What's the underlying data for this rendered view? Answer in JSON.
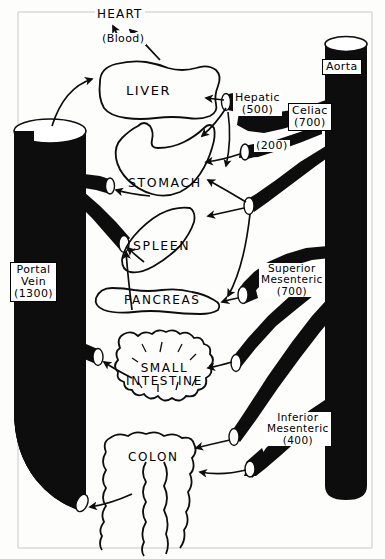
{
  "figure": {
    "background_color": "#fdfdfc",
    "ink_color": "#000000"
  },
  "annotations": {
    "heart": "HEART",
    "blood": "(Blood)"
  },
  "vessels": [
    {
      "id": "aorta",
      "name": "Aorta",
      "label": "Aorta",
      "flow": "",
      "label_style": "boxed",
      "x": 322,
      "y": 59,
      "font_size": 11
    },
    {
      "id": "portal-vein",
      "name": "Portal Vein",
      "label": "Portal\nVein\n(1300)",
      "flow": "1300",
      "label_style": "boxed",
      "x": 10,
      "y": 262,
      "font_size": 11
    },
    {
      "id": "hepatic-artery",
      "name": "Hepatic",
      "label": "Hepatic\n(500)",
      "flow": "500",
      "label_style": "plain",
      "x": 233,
      "y": 92,
      "font_size": 11
    },
    {
      "id": "celiac-artery",
      "name": "Celiac",
      "label": "Celiac\n(700)",
      "flow": "700",
      "label_style": "boxed",
      "x": 288,
      "y": 103,
      "font_size": 11
    },
    {
      "id": "left-gastric-artery",
      "name": "(200)",
      "label": "(200)",
      "flow": "200",
      "label_style": "plain",
      "x": 254,
      "y": 140,
      "font_size": 11
    },
    {
      "id": "superior-mesenteric-artery",
      "name": "Superior Mesenteric",
      "label": "Superior\nMesenteric\n(700)",
      "flow": "700",
      "label_style": "plain",
      "x": 259,
      "y": 263,
      "font_size": 10.5
    },
    {
      "id": "inferior-mesenteric-artery",
      "name": "Inferior Mesenteric",
      "label": "Inferior\nMesenteric\n(400)",
      "flow": "400",
      "label_style": "plain",
      "x": 265,
      "y": 412,
      "font_size": 10.5
    }
  ],
  "organs": [
    {
      "id": "liver",
      "label": "LIVER",
      "x": 126,
      "y": 84,
      "font_size": 13
    },
    {
      "id": "stomach",
      "label": "STOMACH",
      "x": 128,
      "y": 176,
      "font_size": 12.5
    },
    {
      "id": "spleen",
      "label": "SPLEEN",
      "x": 133,
      "y": 239,
      "font_size": 12.5
    },
    {
      "id": "pancreas",
      "label": "PANCREAS",
      "x": 124,
      "y": 294,
      "font_size": 12
    },
    {
      "id": "small-intestine",
      "label": "SMALL\nINTESTINE",
      "x": 126,
      "y": 362,
      "font_size": 12
    },
    {
      "id": "colon",
      "label": "COLON",
      "x": 128,
      "y": 451,
      "font_size": 12
    }
  ]
}
